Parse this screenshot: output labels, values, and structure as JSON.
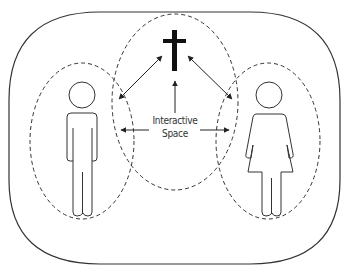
{
  "diagram": {
    "label_line1": "Interactive",
    "label_line2": "Space",
    "nodes": [
      {
        "id": "cross",
        "icon": "cross-icon",
        "role": "divine"
      },
      {
        "id": "man",
        "icon": "man-figure-icon"
      },
      {
        "id": "woman",
        "icon": "woman-figure-icon"
      }
    ],
    "regions": [
      {
        "id": "outer-boundary",
        "style": "solid"
      },
      {
        "id": "left-ellipse",
        "style": "dashed"
      },
      {
        "id": "center-ellipse",
        "style": "dashed"
      },
      {
        "id": "right-ellipse",
        "style": "dashed"
      }
    ],
    "arrows": [
      {
        "from": "cross",
        "to": "man",
        "direction": "bidirectional"
      },
      {
        "from": "cross",
        "to": "woman",
        "direction": "bidirectional"
      },
      {
        "from": "interactive-space",
        "to": "cross",
        "direction": "up"
      },
      {
        "from": "interactive-space",
        "to": "man",
        "direction": "left"
      },
      {
        "from": "interactive-space",
        "to": "woman",
        "direction": "right"
      }
    ],
    "colors": {
      "stroke": "#333333",
      "cross": "#111111",
      "background": "#ffffff"
    }
  }
}
